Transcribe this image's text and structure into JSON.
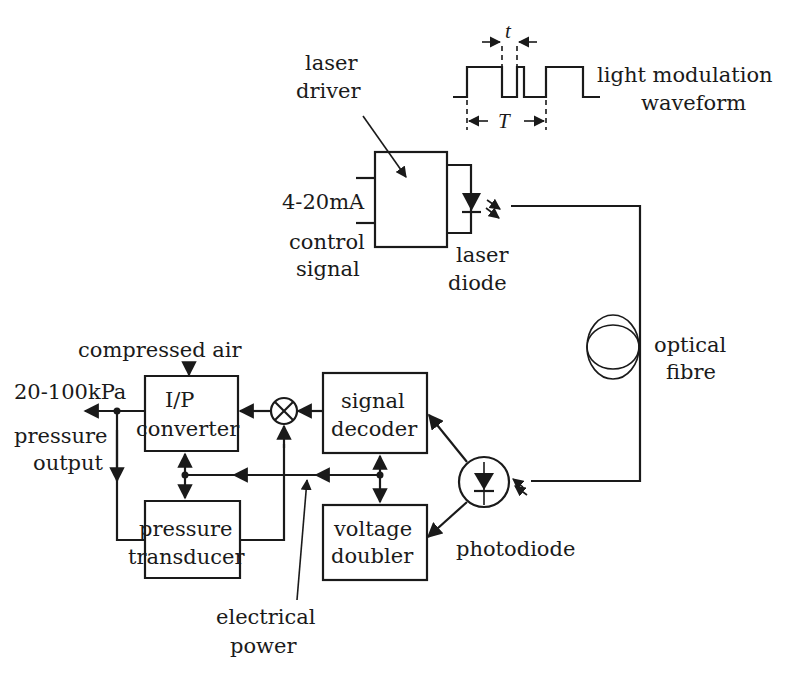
{
  "diagram": {
    "waveform": {
      "label_line1": "light modulation",
      "label_line2": "waveform",
      "short_interval": "t",
      "period": "T"
    },
    "laser_driver": {
      "label_line1": "laser",
      "label_line2": "driver"
    },
    "input_signal": {
      "value": "4-20mA",
      "label_line1": "control",
      "label_line2": "signal"
    },
    "laser_diode": {
      "label_line1": "laser",
      "label_line2": "diode"
    },
    "optical_fibre": {
      "label_line1": "optical",
      "label_line2": "fibre"
    },
    "photodiode": {
      "label": "photodiode"
    },
    "signal_decoder": {
      "label_line1": "signal",
      "label_line2": "decoder"
    },
    "voltage_doubler": {
      "label_line1": "voltage",
      "label_line2": "doubler"
    },
    "ip_converter": {
      "label_line1": "I/P",
      "label_line2": "converter"
    },
    "pressure_transducer": {
      "label_line1": "pressure",
      "label_line2": "transducer"
    },
    "compressed_air": {
      "label": "compressed air"
    },
    "pressure_output": {
      "value": "20-100kPa",
      "label_line1": "pressure",
      "label_line2": "output"
    },
    "electrical_power": {
      "label_line1": "electrical",
      "label_line2": "power"
    }
  }
}
